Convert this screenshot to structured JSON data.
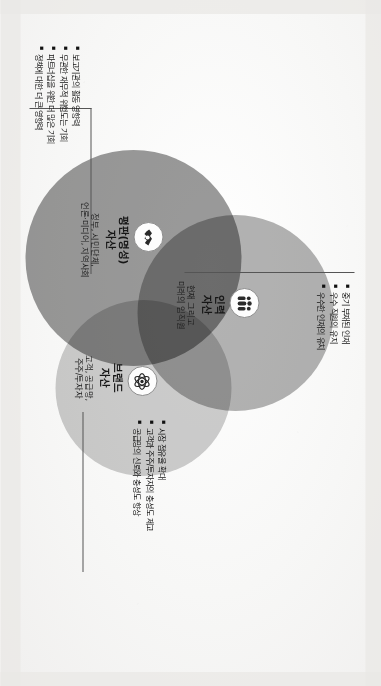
{
  "figure": {
    "type": "venn-diagram-3-circle",
    "orientation": "rotated-90-clockwise"
  },
  "circles": [
    {
      "key": "reputation",
      "title": "평판(명성)\n자산",
      "subtitle": "정부, 시민단체,\n언론·미디어, 지역사회",
      "icon": "handshake-icon",
      "color": "#9a9a9a"
    },
    {
      "key": "human",
      "title": "인력\n자산",
      "subtitle": "현재 그리고\n미래의 임직원",
      "icon": "people-group-icon",
      "color": "#b3b3b3"
    },
    {
      "key": "brand",
      "title": "브랜드\n자산",
      "subtitle": "고객, 공급망,\n주주/투자자",
      "icon": "atom-icon",
      "color": "#cecece"
    }
  ],
  "bullet_groups": [
    {
      "key": "human",
      "items": [
        "중기 부재된 인재",
        "우수 직원의 유지",
        "우수한 인재의 유치"
      ]
    },
    {
      "key": "reputation",
      "items": [
        "보고기관의 활동 영향력",
        "무관한 재무적 위험도는 기회",
        "파트너십을 위한 더 많은 기회",
        "정책에 대한 더 큰 영향력"
      ]
    },
    {
      "key": "brand",
      "items": [
        "시장 점유율 확대",
        "고객과 주주/투자자의 충성도 제고",
        "공급망의 신뢰와 충성도 향상"
      ]
    }
  ]
}
